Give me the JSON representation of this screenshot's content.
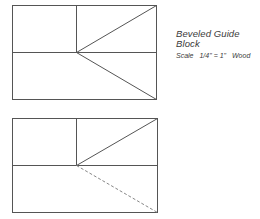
{
  "caption": {
    "title": "Beveled Guide Block",
    "scale_label": "Scale",
    "scale_value": "1/4\" = 1\"",
    "material": "Wood"
  },
  "figures": [
    {
      "name": "top-view",
      "rect": {
        "x": 12,
        "y": 5,
        "w": 144,
        "h": 94
      },
      "mid_y": 52,
      "divider_x": 76,
      "diagonals": [
        "solid",
        "solid"
      ]
    },
    {
      "name": "bottom-view",
      "rect": {
        "x": 12,
        "y": 118,
        "w": 145,
        "h": 94
      },
      "mid_y": 165,
      "divider_x": 76,
      "diagonals": [
        "solid",
        "dashed"
      ]
    }
  ],
  "colors": {
    "line": "#555555",
    "dashed_line": "#888888",
    "text": "#3a3a3a"
  }
}
